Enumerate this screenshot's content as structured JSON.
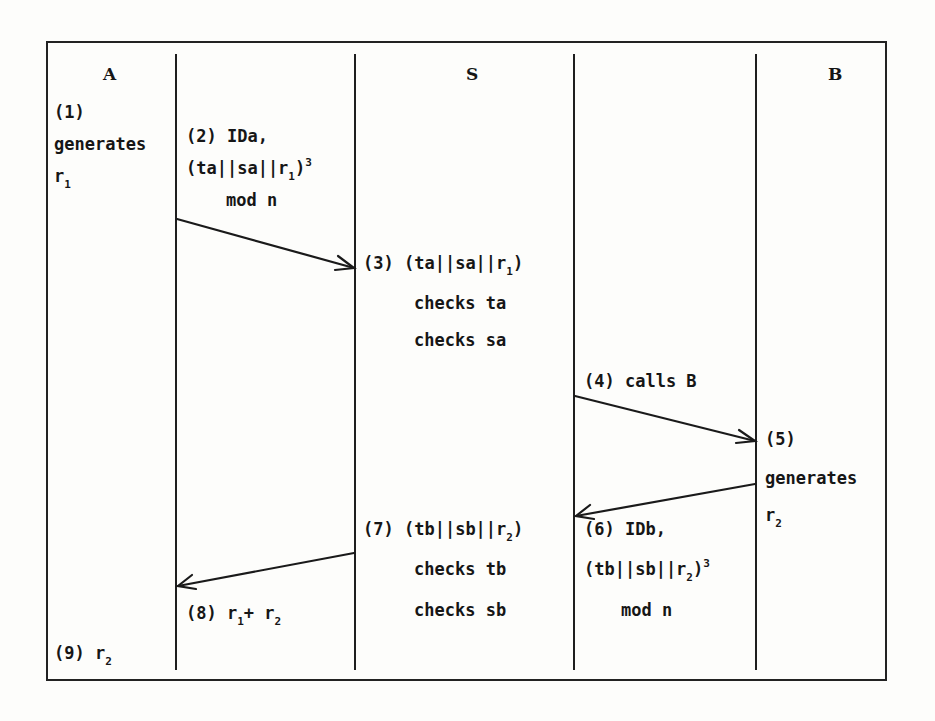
{
  "diagram": {
    "type": "protocol-sequence",
    "participants": [
      {
        "id": "A",
        "label": "A"
      },
      {
        "id": "S",
        "label": "S"
      },
      {
        "id": "B",
        "label": "B"
      }
    ],
    "steps": {
      "s1": {
        "num": "(1)",
        "line1": "generates",
        "var": "r",
        "sub": "1"
      },
      "s2": {
        "num": "(2) IDa,",
        "expr_pre": "(ta||sa||r",
        "sub": "1",
        "expr_post": ")",
        "sup": "3",
        "line3": "mod n"
      },
      "s3": {
        "num": "(3)",
        "expr_pre": "(ta||sa||r",
        "sub": "1",
        "expr_post": ")",
        "line2": "checks ta",
        "line3": "checks sa"
      },
      "s4": {
        "text": "(4) calls B"
      },
      "s5": {
        "num": "(5)",
        "line1": "generates",
        "var": "r",
        "sub": "2"
      },
      "s6": {
        "num": "(6) IDb,",
        "expr_pre": "(tb||sb||r",
        "sub": "2",
        "expr_post": ")",
        "sup": "3",
        "line3": "mod n"
      },
      "s7": {
        "num": "(7)",
        "expr_pre": "(tb||sb||r",
        "sub": "2",
        "expr_post": ")",
        "line2": "checks tb",
        "line3": "checks sb"
      },
      "s8": {
        "num": "(8)",
        "var1": "r",
        "sub1": "1",
        "op": "+ ",
        "var2": "r",
        "sub2": "2"
      },
      "s9": {
        "num": "(9)",
        "var": "r",
        "sub": "2"
      }
    },
    "messages": [
      {
        "from": "A",
        "to": "S",
        "label_step": "2"
      },
      {
        "from": "S",
        "to": "B",
        "label_step": "4"
      },
      {
        "from": "B",
        "to": "S",
        "label_step": "6"
      },
      {
        "from": "S",
        "to": "A",
        "label_step": "8"
      }
    ],
    "colors": {
      "ink": "#161616",
      "paper": "#fdfdfb"
    }
  }
}
